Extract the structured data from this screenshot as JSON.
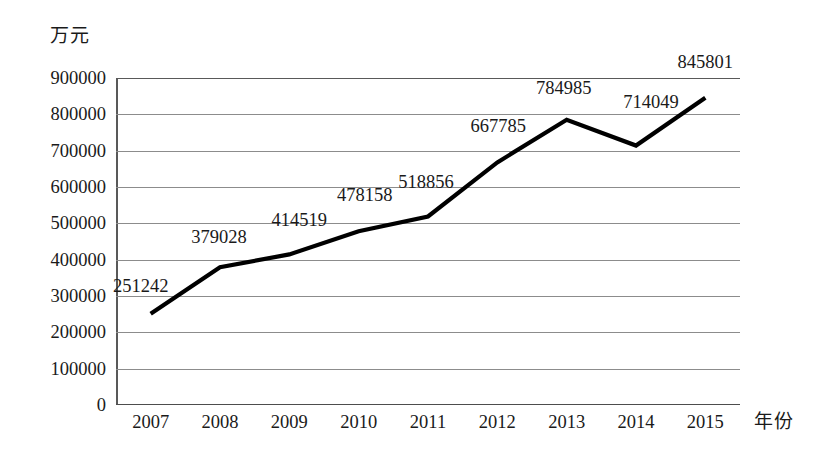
{
  "chart_data": {
    "type": "line",
    "title": "",
    "xlabel": "年份",
    "ylabel": "万元",
    "categories": [
      "2007",
      "2008",
      "2009",
      "2010",
      "2011",
      "2012",
      "2013",
      "2014",
      "2015"
    ],
    "values": [
      251242,
      379028,
      414519,
      478158,
      518856,
      667785,
      784985,
      714049,
      845801
    ],
    "point_labels": [
      "251242",
      "379028",
      "414519",
      "478158",
      "518856",
      "667785",
      "784985",
      "714049",
      "845801"
    ],
    "ylim": [
      0,
      900000
    ],
    "ytick_labels": [
      "900000",
      "800000",
      "700000",
      "600000",
      "500000",
      "400000",
      "300000",
      "200000",
      "100000",
      "0"
    ],
    "ytick_values": [
      900000,
      800000,
      700000,
      600000,
      500000,
      400000,
      300000,
      200000,
      100000,
      0
    ],
    "ytick_step": 100000,
    "grid": true,
    "legend": "none",
    "series_color": "#000000",
    "grid_color": "#8c8c8c",
    "axis_color": "#4d4d4d",
    "background_color": "#ffffff"
  }
}
